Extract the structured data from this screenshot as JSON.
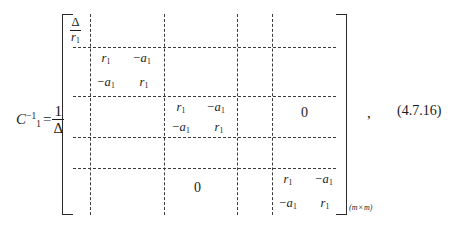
{
  "equation": {
    "lhs": {
      "matrix_symbol": "C",
      "matrix_subscript": "1",
      "matrix_superscript": "−1",
      "equals": "=",
      "coefficient_numerator": "1",
      "coefficient_denominator": "Δ"
    },
    "matrix": {
      "corner_entry": {
        "numerator": "Δ",
        "denominator": "r",
        "denominator_subscript": "1"
      },
      "blocks": [
        {
          "name": "block-1",
          "cells": [
            {
              "sign": "",
              "symbol": "r",
              "subscript": "1"
            },
            {
              "sign": "−",
              "symbol": "a",
              "subscript": "1"
            },
            {
              "sign": "−",
              "symbol": "a",
              "subscript": "1"
            },
            {
              "sign": "",
              "symbol": "r",
              "subscript": "1"
            }
          ]
        },
        {
          "name": "block-2",
          "cells": [
            {
              "sign": "",
              "symbol": "r",
              "subscript": "1"
            },
            {
              "sign": "−",
              "symbol": "a",
              "subscript": "1"
            },
            {
              "sign": "−",
              "symbol": "a",
              "subscript": "1"
            },
            {
              "sign": "",
              "symbol": "r",
              "subscript": "1"
            }
          ]
        },
        {
          "name": "block-3",
          "cells": [
            {
              "sign": "",
              "symbol": "r",
              "subscript": "1"
            },
            {
              "sign": "−",
              "symbol": "a",
              "subscript": "1"
            },
            {
              "sign": "−",
              "symbol": "a",
              "subscript": "1"
            },
            {
              "sign": "",
              "symbol": "r",
              "subscript": "1"
            }
          ]
        }
      ],
      "zero_upper_right": "0",
      "zero_lower_left": "0",
      "dimension": {
        "rows": "m",
        "times": "×",
        "cols": "m"
      }
    },
    "trailing_punctuation": ",",
    "number": "(4.7.16)"
  },
  "colors": {
    "ink": "#1a1a1a",
    "rule": "#2a2a2a",
    "dashed_rule": "#3a3a3a",
    "background": "#ffffff"
  }
}
